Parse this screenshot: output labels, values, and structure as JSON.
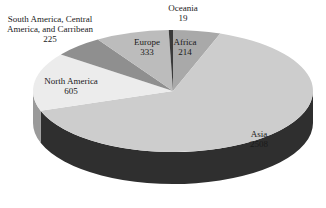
{
  "chart_data": {
    "type": "pie",
    "style": "3d",
    "title": "",
    "categories": [
      "Africa",
      "Asia",
      "North America",
      "South America, Central America, and Carribean",
      "Europe",
      "Oceania"
    ],
    "values": [
      214,
      2508,
      605,
      225,
      333,
      19
    ],
    "colors": [
      "#a9a9a9",
      "#cdcdcd",
      "#ececec",
      "#8f8f8f",
      "#bcbcbc",
      "#3a3a3a"
    ],
    "side_colors": [
      "#6e6e6e",
      "#2f2f2f",
      "#9a9a9a",
      "#5c5c5c",
      "#7a7a7a",
      "#1a1a1a"
    ],
    "start_angle_deg": 0,
    "direction": "clockwise",
    "legend": "none",
    "data_labels": true
  },
  "labels": [
    {
      "name": "Oceania",
      "value": "19",
      "x": 183,
      "y": 3
    },
    {
      "name": "Africa",
      "value": "214",
      "x": 185,
      "y": 37
    },
    {
      "name": "Europe",
      "value": "333",
      "x": 147,
      "y": 37
    },
    {
      "name": "South America, Central",
      "name2": "America, and Carribean",
      "value": "225",
      "x": 50,
      "y": 14
    },
    {
      "name": "North America",
      "value": "605",
      "x": 71,
      "y": 76
    },
    {
      "name": "Asia",
      "value": "2508",
      "x": 259,
      "y": 129
    }
  ]
}
